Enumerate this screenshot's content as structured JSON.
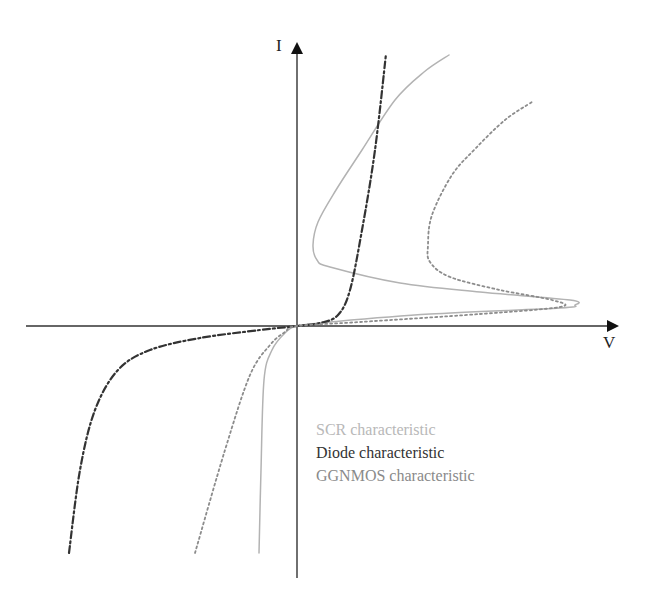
{
  "chart_data": {
    "type": "line",
    "title": "",
    "xlabel": "V",
    "ylabel": "I",
    "grid": false,
    "legend_position": "lower-right of origin, below x-axis",
    "axes": {
      "origin_px": [
        297,
        326
      ],
      "x_axis_px": [
        26,
        619
      ],
      "y_axis_px": [
        578,
        42
      ]
    },
    "series": [
      {
        "name": "SCR characteristic",
        "style": "solid",
        "color": "#b3b3b3",
        "points_px": [
          [
            259,
            553
          ],
          [
            261,
            470
          ],
          [
            264,
            380
          ],
          [
            272,
            350
          ],
          [
            285,
            333
          ],
          [
            297,
            326
          ],
          [
            330,
            322
          ],
          [
            430,
            314
          ],
          [
            560,
            308
          ],
          [
            575,
            305
          ],
          [
            570,
            300
          ],
          [
            480,
            292
          ],
          [
            400,
            283
          ],
          [
            330,
            267
          ],
          [
            317,
            260
          ],
          [
            313,
            245
          ],
          [
            318,
            222
          ],
          [
            336,
            190
          ],
          [
            362,
            150
          ],
          [
            395,
            100
          ],
          [
            424,
            72
          ],
          [
            449,
            55
          ]
        ]
      },
      {
        "name": "Diode characteristic",
        "style": "dash-dot",
        "color": "#333333",
        "points_px": [
          [
            69,
            553
          ],
          [
            80,
            470
          ],
          [
            95,
            410
          ],
          [
            118,
            370
          ],
          [
            150,
            350
          ],
          [
            200,
            338
          ],
          [
            260,
            330
          ],
          [
            297,
            326
          ],
          [
            320,
            323
          ],
          [
            338,
            315
          ],
          [
            350,
            290
          ],
          [
            362,
            230
          ],
          [
            375,
            150
          ],
          [
            386,
            54
          ]
        ]
      },
      {
        "name": "GGNMOS characteristic",
        "style": "dotted",
        "color": "#8c8c8c",
        "points_px": [
          [
            195,
            553
          ],
          [
            225,
            450
          ],
          [
            250,
            375
          ],
          [
            270,
            345
          ],
          [
            285,
            332
          ],
          [
            297,
            326
          ],
          [
            360,
            322
          ],
          [
            480,
            314
          ],
          [
            560,
            307
          ],
          [
            552,
            300
          ],
          [
            500,
            290
          ],
          [
            450,
            277
          ],
          [
            430,
            262
          ],
          [
            428,
            245
          ],
          [
            432,
            215
          ],
          [
            452,
            175
          ],
          [
            476,
            148
          ],
          [
            505,
            120
          ],
          [
            532,
            102
          ]
        ]
      }
    ]
  },
  "axes": {
    "x_label": "V",
    "y_label": "I"
  },
  "legend": {
    "items": [
      {
        "label": "SCR characteristic",
        "color": "#b8b8b8"
      },
      {
        "label": "Diode characteristic",
        "color": "#333333"
      },
      {
        "label": "GGNMOS characteristic",
        "color": "#8a8a8a"
      }
    ]
  }
}
